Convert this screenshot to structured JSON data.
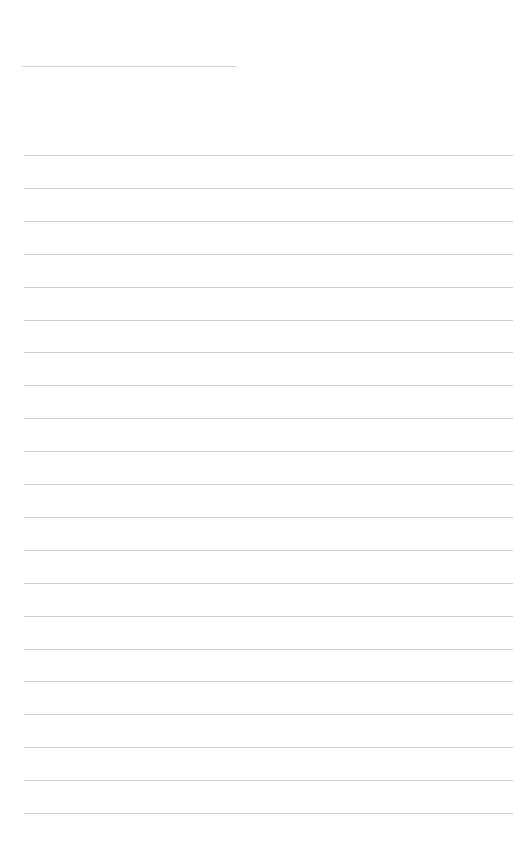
{
  "page": {
    "type": "blank lined writing page",
    "header_line": {
      "present": true
    },
    "ruled_lines": {
      "count": 21,
      "first_y": 155,
      "spacing": 32.9
    },
    "text": []
  }
}
